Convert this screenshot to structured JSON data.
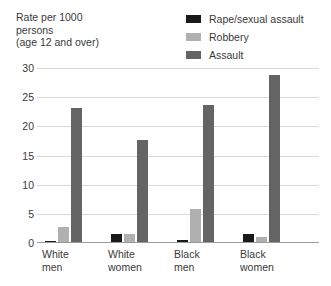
{
  "axis_caption": "Rate per 1000\npersons\n(age 12 and over)",
  "legend": {
    "items": [
      {
        "label": "Rape/sexual assault",
        "color": "#1a1a1a",
        "swatch_name": "legend-swatch-rape-sexual-assault"
      },
      {
        "label": "Robbery",
        "color": "#b0b0b0",
        "swatch_name": "legend-swatch-robbery"
      },
      {
        "label": "Assault",
        "color": "#646464",
        "swatch_name": "legend-swatch-assault"
      }
    ]
  },
  "chart_data": {
    "type": "bar",
    "title": "",
    "subtitle": "",
    "xlabel": "",
    "ylabel": "Rate per 1000 persons (age 12 and over)",
    "categories": [
      "White\nmen",
      "White\nwomen",
      "Black\nmen",
      "Black\nwomen"
    ],
    "category_labels_flat": [
      "White men",
      "White women",
      "Black men",
      "Black women"
    ],
    "series": [
      {
        "name": "Rape/sexual assault",
        "color": "#1a1a1a",
        "values": [
          0.3,
          1.5,
          0.5,
          1.6
        ]
      },
      {
        "name": "Robbery",
        "color": "#b0b0b0",
        "values": [
          2.8,
          1.6,
          5.8,
          1.1
        ]
      },
      {
        "name": "Assault",
        "color": "#646464",
        "values": [
          23.2,
          17.6,
          23.7,
          28.8
        ]
      }
    ],
    "ylim": [
      0,
      30
    ],
    "yticks": [
      0,
      5,
      10,
      15,
      20,
      25,
      30
    ],
    "ytick_labels": [
      "0",
      "5",
      "10",
      "15",
      "20",
      "25",
      "30"
    ],
    "grid": true,
    "legend_position": "top-right"
  }
}
